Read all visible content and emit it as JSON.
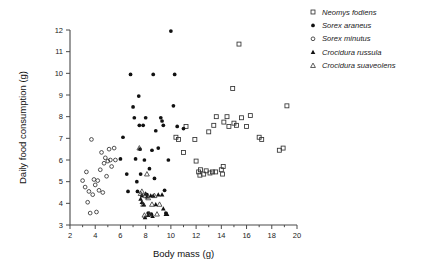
{
  "chart_data": {
    "type": "scatter",
    "title": "",
    "xlabel": "Body mass (g)",
    "ylabel": "Daily food consumption (g)",
    "xlim": [
      2,
      20
    ],
    "ylim": [
      3,
      12
    ],
    "xticks": [
      2,
      4,
      6,
      8,
      10,
      12,
      14,
      16,
      18,
      20
    ],
    "xticklabels": [
      "2",
      "4",
      "6",
      "8",
      "10",
      "12",
      "14",
      "16",
      "18",
      "20"
    ],
    "xminorticks": [
      3,
      5,
      7,
      9,
      11,
      13,
      15,
      17,
      19
    ],
    "yticks": [
      3,
      4,
      5,
      6,
      7,
      8,
      9,
      10,
      11,
      12
    ],
    "yticklabels": [
      "3",
      "4",
      "5",
      "6",
      "7",
      "8",
      "9",
      "10",
      "11",
      "12"
    ],
    "grid": false,
    "legend_position": "right-top",
    "series": [
      {
        "name": "Neomys fodiens",
        "marker": "open-square",
        "points": [
          [
            11.0,
            6.35
          ],
          [
            11.2,
            7.55
          ],
          [
            11.9,
            6.95
          ],
          [
            12.0,
            5.95
          ],
          [
            12.2,
            5.45
          ],
          [
            12.3,
            5.3
          ],
          [
            12.35,
            5.55
          ],
          [
            12.6,
            5.35
          ],
          [
            12.8,
            5.5
          ],
          [
            13.0,
            7.3
          ],
          [
            13.1,
            5.4
          ],
          [
            13.3,
            5.45
          ],
          [
            13.4,
            7.6
          ],
          [
            13.55,
            5.45
          ],
          [
            13.6,
            8.0
          ],
          [
            14.0,
            5.55
          ],
          [
            14.1,
            5.35
          ],
          [
            14.15,
            5.7
          ],
          [
            14.2,
            7.75
          ],
          [
            14.45,
            8.0
          ],
          [
            14.6,
            7.55
          ],
          [
            14.9,
            9.3
          ],
          [
            15.0,
            7.7
          ],
          [
            15.2,
            7.6
          ],
          [
            15.4,
            11.35
          ],
          [
            15.6,
            7.95
          ],
          [
            16.0,
            7.55
          ],
          [
            16.3,
            8.05
          ],
          [
            17.0,
            7.05
          ],
          [
            17.2,
            6.95
          ],
          [
            18.6,
            6.45
          ],
          [
            18.9,
            6.55
          ],
          [
            19.2,
            8.5
          ],
          [
            10.4,
            7.05
          ],
          [
            10.6,
            6.95
          ]
        ]
      },
      {
        "name": "Sorex araneus",
        "marker": "filled-circle",
        "points": [
          [
            6.2,
            7.05
          ],
          [
            6.5,
            5.35
          ],
          [
            6.6,
            4.55
          ],
          [
            6.8,
            9.95
          ],
          [
            7.0,
            8.45
          ],
          [
            7.1,
            7.95
          ],
          [
            7.2,
            6.05
          ],
          [
            7.3,
            5.0
          ],
          [
            7.35,
            4.55
          ],
          [
            7.45,
            8.95
          ],
          [
            7.5,
            7.6
          ],
          [
            7.55,
            6.5
          ],
          [
            7.6,
            5.35
          ],
          [
            7.7,
            4.35
          ],
          [
            7.8,
            7.6
          ],
          [
            7.9,
            6.0
          ],
          [
            8.0,
            7.95
          ],
          [
            8.1,
            4.4
          ],
          [
            8.2,
            3.55
          ],
          [
            8.3,
            5.6
          ],
          [
            8.45,
            3.5
          ],
          [
            8.5,
            6.45
          ],
          [
            8.6,
            9.95
          ],
          [
            8.7,
            5.15
          ],
          [
            8.8,
            7.35
          ],
          [
            9.0,
            6.55
          ],
          [
            9.2,
            7.95
          ],
          [
            9.3,
            7.8
          ],
          [
            9.4,
            7.6
          ],
          [
            9.5,
            4.6
          ],
          [
            9.8,
            6.0
          ],
          [
            10.0,
            11.95
          ],
          [
            10.2,
            8.5
          ],
          [
            10.3,
            9.95
          ],
          [
            10.5,
            7.55
          ],
          [
            11.0,
            7.45
          ],
          [
            6.0,
            6.05
          ],
          [
            9.6,
            3.55
          ]
        ]
      },
      {
        "name": "Sorex minutus",
        "marker": "open-circle",
        "points": [
          [
            3.0,
            5.05
          ],
          [
            3.2,
            4.75
          ],
          [
            3.3,
            5.45
          ],
          [
            3.4,
            4.05
          ],
          [
            3.5,
            4.55
          ],
          [
            3.6,
            3.55
          ],
          [
            3.8,
            4.4
          ],
          [
            3.9,
            5.1
          ],
          [
            4.0,
            4.85
          ],
          [
            4.1,
            3.6
          ],
          [
            4.2,
            5.05
          ],
          [
            4.3,
            4.6
          ],
          [
            4.4,
            5.55
          ],
          [
            4.5,
            6.35
          ],
          [
            4.6,
            4.5
          ],
          [
            4.7,
            5.85
          ],
          [
            4.8,
            6.1
          ],
          [
            5.0,
            5.95
          ],
          [
            5.1,
            6.5
          ],
          [
            5.2,
            6.0
          ],
          [
            5.3,
            5.7
          ],
          [
            5.5,
            6.55
          ],
          [
            5.6,
            6.0
          ],
          [
            3.7,
            6.95
          ],
          [
            4.9,
            5.25
          ]
        ]
      },
      {
        "name": "Crocidura russula",
        "marker": "filled-triangle",
        "points": [
          [
            7.6,
            4.2
          ],
          [
            7.7,
            4.05
          ],
          [
            7.85,
            3.95
          ],
          [
            8.0,
            4.45
          ],
          [
            8.1,
            4.3
          ],
          [
            8.2,
            3.45
          ],
          [
            8.4,
            4.35
          ],
          [
            8.6,
            4.35
          ],
          [
            8.8,
            3.95
          ],
          [
            9.0,
            4.4
          ],
          [
            9.3,
            4.4
          ],
          [
            9.4,
            3.75
          ],
          [
            9.6,
            3.5
          ],
          [
            9.7,
            3.5
          ],
          [
            7.95,
            3.35
          ],
          [
            8.55,
            3.4
          ]
        ]
      },
      {
        "name": "Crocidura suaveolens",
        "marker": "open-triangle",
        "points": [
          [
            7.5,
            6.55
          ],
          [
            7.6,
            4.45
          ],
          [
            7.8,
            3.95
          ],
          [
            7.9,
            3.45
          ],
          [
            8.0,
            4.35
          ],
          [
            8.2,
            4.25
          ],
          [
            8.3,
            3.5
          ],
          [
            8.5,
            3.95
          ],
          [
            8.7,
            4.35
          ],
          [
            8.9,
            3.5
          ],
          [
            9.1,
            3.95
          ],
          [
            8.1,
            5.35
          ],
          [
            7.7,
            4.55
          ]
        ]
      }
    ]
  },
  "legend": {
    "entries": [
      {
        "label": "Neomys fodiens",
        "marker": "open-square"
      },
      {
        "label": "Sorex araneus",
        "marker": "filled-circle"
      },
      {
        "label": "Sorex minutus",
        "marker": "open-circle"
      },
      {
        "label": "Crocidura russula",
        "marker": "filled-triangle"
      },
      {
        "label": "Crocidura suaveolens",
        "marker": "open-triangle"
      }
    ]
  }
}
